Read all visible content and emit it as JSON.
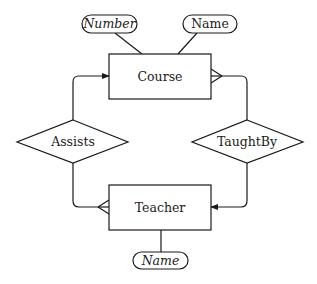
{
  "diagram": {
    "type": "entity-relationship",
    "entities": [
      {
        "id": "course",
        "label": "Course"
      },
      {
        "id": "teacher",
        "label": "Teacher"
      }
    ],
    "relationships": [
      {
        "id": "assists",
        "label": "Assists"
      },
      {
        "id": "taughtby",
        "label": "TaughtBy"
      }
    ],
    "attributes": [
      {
        "id": "course_number",
        "label": "Number",
        "of": "course",
        "italic": true
      },
      {
        "id": "course_name",
        "label": "Name",
        "of": "course",
        "italic": false
      },
      {
        "id": "teacher_name",
        "label": "Name",
        "of": "teacher",
        "italic": true
      }
    ],
    "edges": [
      {
        "from": "assists",
        "to": "course",
        "end": "arrow"
      },
      {
        "from": "assists",
        "to": "teacher",
        "end": "crows-foot"
      },
      {
        "from": "taughtby",
        "to": "course",
        "end": "crows-foot"
      },
      {
        "from": "taughtby",
        "to": "teacher",
        "end": "arrow"
      },
      {
        "from": "course_number",
        "to": "course",
        "end": "none"
      },
      {
        "from": "course_name",
        "to": "course",
        "end": "none"
      },
      {
        "from": "teacher_name",
        "to": "teacher",
        "end": "none"
      }
    ],
    "colors": {
      "stroke": "#1a1a1a",
      "background": "#ffffff"
    }
  }
}
